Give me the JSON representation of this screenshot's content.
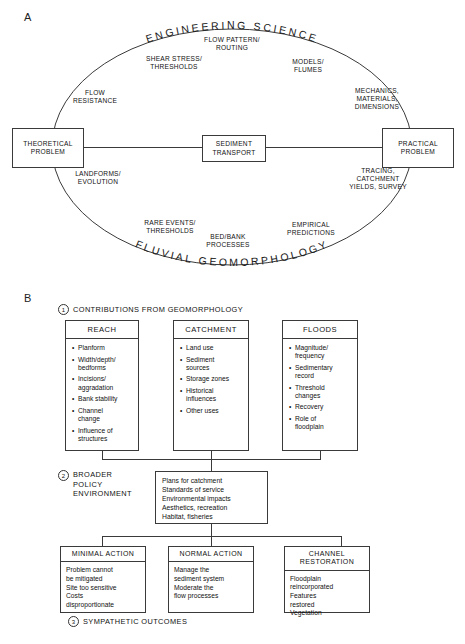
{
  "figure": {
    "panel_a_letter": "A",
    "panel_b_letter": "B"
  },
  "panel_a": {
    "arc_top_label": "ENGINEERING SCIENCE",
    "arc_bottom_label": "FLUVIAL GEOMORPHOLOGY",
    "boxes": {
      "left": "THEORETICAL\nPROBLEM",
      "center": "SEDIMENT\nTRANSPORT",
      "right": "PRACTICAL\nPROBLEM"
    },
    "labels": {
      "flow_pattern_routing": "FLOW PATTERN/\nROUTING",
      "shear_stress_thresholds": "SHEAR STRESS/\nTHRESHOLDS",
      "models_flumes": "MODELS/\nFLUMES",
      "flow_resistance": "FLOW\nRESISTANCE",
      "mechanics_materials_dimensions": "MECHANICS,\nMATERIALS,\nDIMENSIONS",
      "landforms_evolution": "LANDFORMS/\nEVOLUTION",
      "tracing_catchment_yields_survey": "TRACING,\nCATCHMENT\nYIELDS, SURVEY",
      "rare_events_thresholds": "RARE EVENTS/\nTHRESHOLDS",
      "bed_bank_processes": "BED/BANK\nPROCESSES",
      "empirical_predictions": "EMPIRICAL\nPREDICTIONS"
    }
  },
  "panel_b": {
    "stage1": {
      "number": "1",
      "title": "CONTRIBUTIONS FROM GEOMORPHOLOGY"
    },
    "columns": [
      {
        "header": "REACH",
        "items": [
          "Planform",
          "Width/depth/\nbedforms",
          "Incisions/\naggradation",
          "Bank stability",
          "Channel\nchange",
          "Influence of\nstructures"
        ]
      },
      {
        "header": "CATCHMENT",
        "items": [
          "Land use",
          "Sediment\nsources",
          "Storage zones",
          "Historical\ninfluences",
          "Other uses"
        ]
      },
      {
        "header": "FLOODS",
        "items": [
          "Magnitude/\nfrequency",
          "Sedimentary\nrecord",
          "Threshold\nchanges",
          "Recovery",
          "Role of\nfloodplain"
        ]
      }
    ],
    "stage2": {
      "number": "2",
      "title": "BROADER\nPOLICY\nENVIRONMENT",
      "policy_lines": "Plans for catchment\nStandards of service\nEnvironmental impacts\nAesthetics, recreation\nHabitat, fisheries"
    },
    "stage3": {
      "number": "3",
      "title": "SYMPATHETIC OUTCOMES"
    },
    "outcomes": [
      {
        "header": "MINIMAL ACTION",
        "body": "Problem cannot\n   be mitigated\nSite too sensitive\nCosts\n   disproportionate"
      },
      {
        "header": "NORMAL ACTION",
        "body": "Manage the\n   sediment system\nModerate the\n   flow processes"
      },
      {
        "header": "CHANNEL\nRESTORATION",
        "body": "Floodplain\n   reincorporated\nFeatures\n   restored\nVegetation"
      }
    ]
  }
}
